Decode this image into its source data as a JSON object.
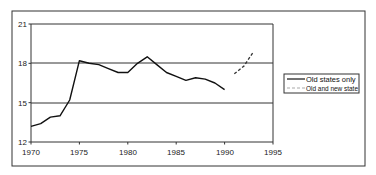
{
  "chart_data": {
    "type": "line",
    "title": "",
    "xlabel": "",
    "ylabel": "",
    "xlim": [
      1970,
      1995
    ],
    "ylim": [
      12,
      21
    ],
    "x_ticks": [
      1970,
      1975,
      1980,
      1985,
      1990,
      1995
    ],
    "y_ticks": [
      12,
      15,
      18,
      21
    ],
    "grid": {
      "horizontal": true,
      "vertical": false
    },
    "legend_position": "right",
    "series": [
      {
        "name": "Old states only",
        "style": "solid",
        "color": "#111111",
        "x": [
          1970,
          1971,
          1972,
          1973,
          1974,
          1975,
          1976,
          1977,
          1978,
          1979,
          1980,
          1981,
          1982,
          1983,
          1984,
          1985,
          1986,
          1987,
          1988,
          1989,
          1990
        ],
        "values": [
          13.2,
          13.4,
          13.9,
          14.0,
          15.2,
          18.2,
          18.0,
          17.9,
          17.6,
          17.3,
          17.3,
          18.0,
          18.5,
          17.9,
          17.3,
          17.0,
          16.7,
          16.9,
          16.8,
          16.5,
          16.0
        ]
      },
      {
        "name": "Old and new states",
        "style": "dashed",
        "color": "#333333",
        "x": [
          1991,
          1992,
          1993
        ],
        "values": [
          17.2,
          17.8,
          18.9
        ]
      }
    ]
  },
  "legend": {
    "items": [
      {
        "label": "Old states only"
      },
      {
        "label": "Old and new state"
      }
    ]
  },
  "axis": {
    "x_labels": [
      "1970",
      "1975",
      "1980",
      "1985",
      "1990",
      "1995"
    ],
    "y_labels": [
      "12",
      "15",
      "18",
      "21"
    ]
  }
}
